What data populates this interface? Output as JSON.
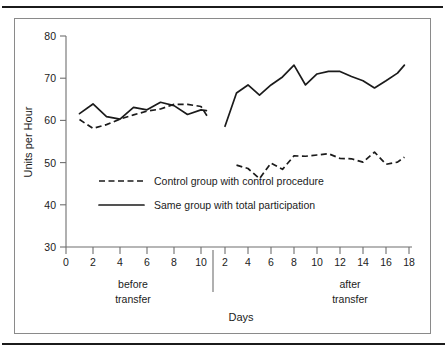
{
  "figure": {
    "background_color": "#ffffff",
    "frame_color": "#8a8a8a",
    "rule_color": "#1b1b1b"
  },
  "chart_data": {
    "type": "line",
    "title": "",
    "xlabel": "Days",
    "ylabel": "Units per Hour",
    "ylim": [
      30,
      80
    ],
    "ytick_labels": [
      "30",
      "40",
      "50",
      "60",
      "70",
      "80"
    ],
    "yticks": [
      30,
      40,
      50,
      60,
      70,
      80
    ],
    "grid": false,
    "legend_position": "inside-lower-left",
    "line_color": "#1b1b1b",
    "panels": [
      {
        "name": "before transfer",
        "segment_label_line1": "before",
        "segment_label_line2": "transfer",
        "xlim": [
          0,
          11
        ],
        "xtick_labels": [
          "0",
          "2",
          "4",
          "6",
          "8",
          "10"
        ],
        "xticks": [
          0,
          2,
          4,
          6,
          8,
          10
        ]
      },
      {
        "name": "after transfer",
        "segment_label_line1": "after",
        "segment_label_line2": "transfer",
        "xlim": [
          1,
          18.6
        ],
        "xtick_labels": [
          "2",
          "4",
          "6",
          "8",
          "10",
          "12",
          "14",
          "16",
          "18"
        ],
        "xticks": [
          2,
          4,
          6,
          8,
          10,
          12,
          14,
          16,
          18
        ]
      }
    ],
    "series": [
      {
        "name": "Control group with control procedure",
        "style": "dashed",
        "before": {
          "x": [
            1,
            2,
            3,
            4,
            5,
            6,
            7,
            8,
            9,
            10,
            10.5
          ],
          "y": [
            60.2,
            58.1,
            59.0,
            60.3,
            61.3,
            62.2,
            62.7,
            63.8,
            63.8,
            63.3,
            60.8
          ]
        },
        "after": {
          "x": [
            3,
            4,
            5,
            6,
            7,
            8,
            9,
            10,
            11,
            12,
            13,
            14,
            15,
            16,
            17,
            17.6
          ],
          "y": [
            49.4,
            48.6,
            46.2,
            49.9,
            48.4,
            51.6,
            51.5,
            51.8,
            52.1,
            51.0,
            50.9,
            50.1,
            52.5,
            49.6,
            50.1,
            51.3
          ]
        }
      },
      {
        "name": "Same group with total participation",
        "style": "solid",
        "before": {
          "x": [
            1,
            2,
            3,
            4,
            5,
            6,
            7,
            8,
            9,
            10,
            10.4
          ],
          "y": [
            61.6,
            63.9,
            60.9,
            60.3,
            63.1,
            62.5,
            64.3,
            63.5,
            61.4,
            62.5,
            62.3
          ]
        },
        "after": {
          "x": [
            2,
            3,
            4,
            5,
            6,
            7,
            8,
            9,
            10,
            11,
            12,
            13,
            14,
            15,
            16,
            17,
            17.6
          ],
          "y": [
            58.6,
            66.5,
            68.4,
            66.0,
            68.4,
            70.3,
            73.1,
            68.4,
            71.0,
            71.6,
            71.6,
            70.4,
            69.4,
            67.7,
            69.4,
            71.2,
            73.1
          ]
        }
      }
    ]
  },
  "legend": {
    "items": [
      {
        "label": "Control group with control procedure",
        "style": "dashed"
      },
      {
        "label": "Same group with total participation",
        "style": "solid"
      }
    ]
  }
}
